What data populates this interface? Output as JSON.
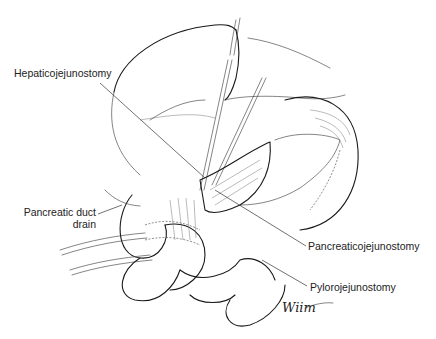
{
  "figure": {
    "type": "surgical illustration",
    "labels": {
      "hepaticojejunostomy": "Hepaticojejunostomy",
      "pancreatic_duct_drain_line1": "Pancreatic duct",
      "pancreatic_duct_drain_line2": "drain",
      "pancreaticojejunostomy": "Pancreaticojejunostomy",
      "pylorojejunostomy": "Pylorojejunostomy"
    },
    "signature": "Wiim"
  }
}
